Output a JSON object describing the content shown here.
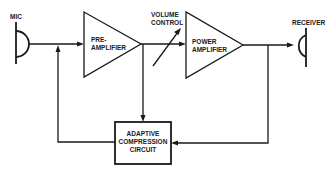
{
  "diagram": {
    "type": "block-diagram",
    "colors": {
      "stroke": "#1a1a1a",
      "background": "#ffffff"
    },
    "nodes": {
      "mic": {
        "label": "MIC",
        "icon": "microphone-icon"
      },
      "preamp": {
        "line1": "PRE-",
        "line2": "AMPLIFIER"
      },
      "volume": {
        "line1": "VOLUME",
        "line2": "CONTROL"
      },
      "poweramp": {
        "line1": "POWER",
        "line2": "AMPLIFIER"
      },
      "receiver": {
        "label": "RECEIVER",
        "icon": "speaker-icon"
      },
      "compression": {
        "line1": "ADAPTIVE",
        "line2": "COMPRESSION",
        "line3": "CIRCUIT"
      }
    },
    "edges": [
      {
        "from": "mic",
        "to": "preamp"
      },
      {
        "from": "preamp",
        "to": "poweramp",
        "via": "volume"
      },
      {
        "from": "poweramp",
        "to": "receiver"
      },
      {
        "from": "preamp",
        "to": "compression"
      },
      {
        "from": "poweramp",
        "to": "compression"
      },
      {
        "from": "compression",
        "to": "preamp-input"
      }
    ]
  }
}
